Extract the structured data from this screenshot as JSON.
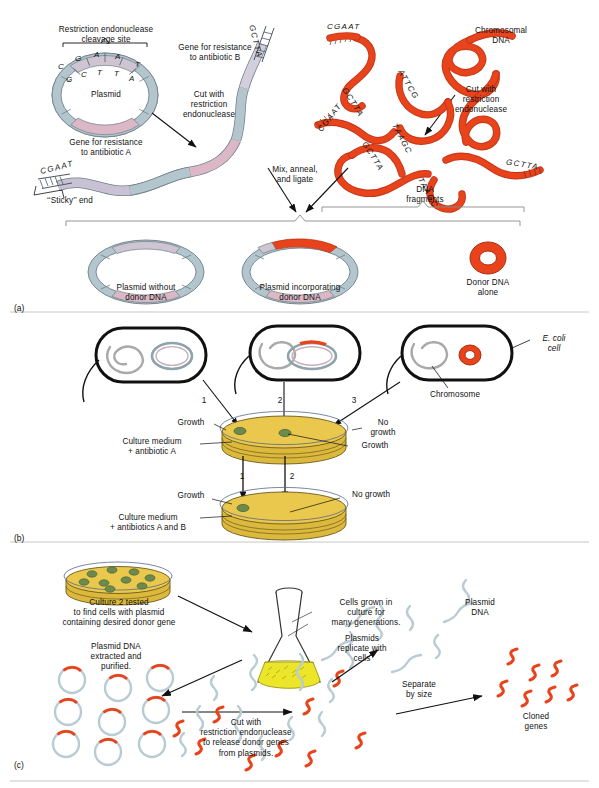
{
  "figure": {
    "panels": [
      {
        "id": "panel-a",
        "label": "(a)"
      },
      {
        "id": "panel-b",
        "label": "(b)"
      },
      {
        "id": "panel-c",
        "label": "(c)"
      }
    ]
  },
  "colors": {
    "plasmid_backbone": "#b3c6ce",
    "plasmid_geneA": "#dcb8c6",
    "plasmid_geneB": "#d3cedc",
    "donor_dna": "#e8431a",
    "chromosome_grey": "#a9a9a9",
    "culture_medium": "#e9c84d",
    "culture_medium_side": "#dcb93c",
    "colony_green": "#6d8a4e",
    "flask_broth": "#ece62a",
    "outline": "#111111",
    "plasmid_dna_pale": "#b9cbd4"
  },
  "panel_a": {
    "label": "(a)",
    "plasmid": {
      "cleavage_site_label": "Restriction endonuclease\ncleavage site",
      "name_label": "Plasmid",
      "gene_a_label": "Gene for resistance\nto antibiotic A",
      "gene_b_label": "Gene for resistance\nto antibiotic B",
      "top_strand_bases": [
        "C",
        "G",
        "A",
        "A",
        "T"
      ],
      "bottom_strand_bases": [
        "G",
        "C",
        "T",
        "T",
        "A"
      ]
    },
    "arrows": {
      "cut_plasmid": "Cut with\nrestriction\nendonuclease",
      "cut_chromosome": "Cut with\nrestriction\nendonuclease",
      "mix_anneal": "Mix, anneal,\nand ligate"
    },
    "linearized_plasmid": {
      "sticky_end_label": "‘‘Sticky’’ end",
      "left_end_sequence": "CGAAT",
      "right_end_sequence": "GCTTA"
    },
    "chromosomal": {
      "label": "Chromosomal\nDNA",
      "fragments_label": "DNA\nfragments",
      "fragment_sequences": [
        "CGAAT",
        "GCTTA",
        "ATTCG",
        "GCTTA",
        "TAAGC",
        "CGAAT",
        "GCTTA",
        "TAAGC"
      ]
    },
    "products": [
      {
        "name": "plasmid-without-donor",
        "label": "Plasmid without\ndonor DNA"
      },
      {
        "name": "plasmid-with-donor",
        "label": "Plasmid incorporating\ndonor DNA"
      },
      {
        "name": "donor-dna-alone",
        "label": "Donor DNA\nalone"
      }
    ]
  },
  "panel_b": {
    "label": "(b)",
    "cells": [
      {
        "name": "cell-1",
        "number": "1"
      },
      {
        "name": "cell-2",
        "number": "2"
      },
      {
        "name": "cell-3",
        "number": "3"
      }
    ],
    "ecoli_label": "E. coli\ncell",
    "chromosome_label": "Chromosome",
    "plate_top": {
      "medium_label": "Culture medium\n+ antibiotic A",
      "growth_left_label": "Growth",
      "growth_right_label": "Growth",
      "no_growth_label": "No\ngrowth"
    },
    "plate_bottom": {
      "medium_label": "Culture medium\n+ antibiotics A and B",
      "growth_label": "Growth",
      "no_growth_label": "No growth",
      "arrow_numbers": [
        "1",
        "2"
      ]
    }
  },
  "panel_c": {
    "label": "(c)",
    "dish_label": "Culture 2 tested\nto find cells with plasmid\ncontaining desired donor gene",
    "flask_label": "Cells grown in\nculture for\nmany generations.",
    "plasmids_replicate_label": "Plasmids\nreplicate with\ncells",
    "extracted_label": "Plasmid DNA\nextracted and\npurified.",
    "cut_label": "Cut with\nrestriction endonuclease\nto release donor genes\nfrom plasmids.",
    "plasmid_dna_label": "Plasmid\nDNA",
    "separate_label": "Separate\nby size",
    "cloned_label": "Cloned\ngenes"
  }
}
